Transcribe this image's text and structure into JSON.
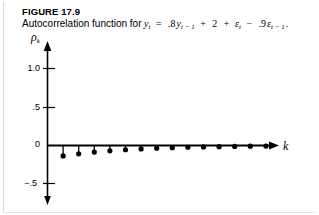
{
  "figure": {
    "number": "FIGURE 17.9",
    "caption_prefix": "Autocorrelation function for",
    "equation_plain": "y_t = .8y_{t-1} + 2 + ε_t − .9ε_{t-1}.",
    "equation_parts": {
      "lhs_var": "y",
      "lhs_sub": "t",
      "equals": "=",
      "coef_ar": ".8",
      "ar_var": "y",
      "ar_sub": "t − 1",
      "plus1": "+",
      "constant": "2",
      "plus2": "+",
      "eps_var": "ε",
      "eps_sub": "t",
      "minus": "−",
      "coef_ma": ".9",
      "ma_var": "ε",
      "ma_sub": "t − 1",
      "period": "."
    }
  },
  "chart_data": {
    "type": "line",
    "subtype": "stem",
    "xlabel": "k",
    "ylabel": "ρ_k",
    "grid": false,
    "legend": null,
    "xlim": [
      0,
      15.5
    ],
    "ylim": [
      -0.75,
      1.15
    ],
    "ytick_labels": [
      "1.0",
      ".5",
      "0",
      "−.5"
    ],
    "ytick_values": [
      1.0,
      0.5,
      0.0,
      -0.5
    ],
    "xtick_labels": [],
    "x": [
      1,
      2,
      3,
      4,
      5,
      6,
      7,
      8,
      9,
      10,
      11,
      12,
      13,
      14
    ],
    "values": [
      -0.135,
      -0.108,
      -0.086,
      -0.069,
      -0.055,
      -0.044,
      -0.036,
      -0.028,
      -0.023,
      -0.018,
      -0.015,
      -0.012,
      -0.009,
      -0.007
    ],
    "marker": "filled-circle",
    "axis_arrow_y": "down",
    "axis_arrow_x": "right"
  }
}
